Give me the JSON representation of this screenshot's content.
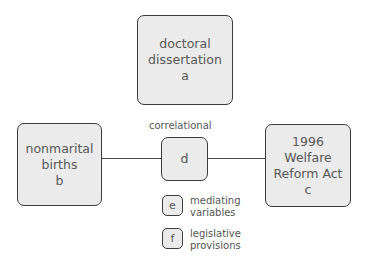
{
  "diagram": {
    "nodes": [
      {
        "id": "a",
        "lines": [
          "doctoral",
          "dissertation",
          "a"
        ]
      },
      {
        "id": "b",
        "lines": [
          "nonmarital",
          "births",
          "b"
        ]
      },
      {
        "id": "c",
        "lines": [
          "1996",
          "Welfare",
          "Reform Act",
          "c"
        ]
      },
      {
        "id": "d",
        "lines": [
          "d"
        ]
      }
    ],
    "edges": [
      {
        "from": "b",
        "to": "d"
      },
      {
        "from": "d",
        "to": "c"
      }
    ],
    "edge_label": "correlational",
    "legend": [
      {
        "key": "e",
        "lines": [
          "mediating",
          "variables"
        ]
      },
      {
        "key": "f",
        "lines": [
          "legislative",
          "provisions"
        ]
      }
    ],
    "colors": {
      "node_fill": "#ebebeb",
      "node_border": "#3c3c3c",
      "text": "#555555",
      "edge": "#4a4a4a"
    }
  }
}
